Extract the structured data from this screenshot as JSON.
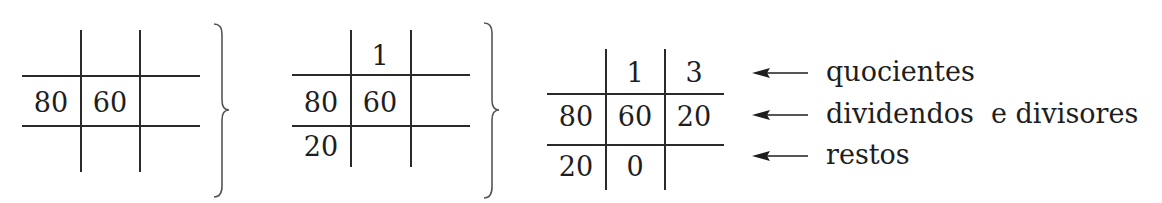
{
  "diagram": {
    "steps": [
      {
        "name": "step-1",
        "rows": [
          [
            "",
            "",
            ""
          ],
          [
            "80",
            "60",
            ""
          ],
          [
            "",
            "",
            ""
          ]
        ]
      },
      {
        "name": "step-2",
        "rows": [
          [
            "",
            "1",
            ""
          ],
          [
            "80",
            "60",
            ""
          ],
          [
            "20",
            "",
            ""
          ]
        ]
      },
      {
        "name": "step-3",
        "rows": [
          [
            "",
            "1",
            "3"
          ],
          [
            "80",
            "60",
            "20"
          ],
          [
            "20",
            "0",
            ""
          ]
        ]
      }
    ],
    "labels": {
      "quotients": "quocientes",
      "dividends_divisors": "dividendos  e divisores",
      "remainders": "restos"
    },
    "line_color": "#2a2a2a",
    "text_color": "#1e1e1e"
  }
}
